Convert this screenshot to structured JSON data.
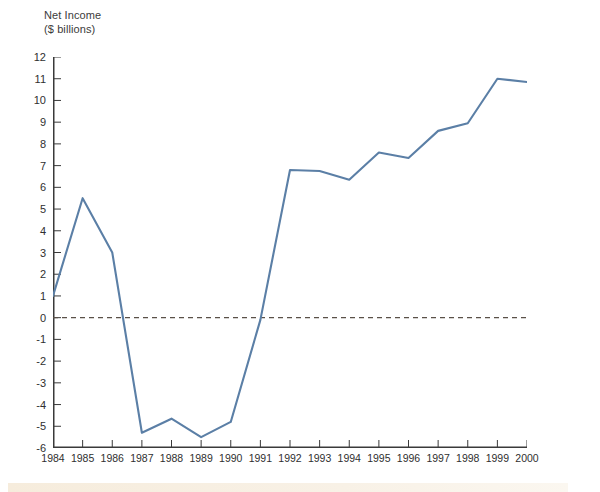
{
  "figure": {
    "title_line1": "Net Income",
    "title_line2": "($ billions)",
    "caption": "",
    "background_color": "#ffffff"
  },
  "colors": {
    "line": "#5b7fa6",
    "axis": "#3a3a3a",
    "zero_line": "#5a5048",
    "tick_label": "#2f2f2f",
    "title": "#3b3b3b",
    "caption_band": "#f6ecdc"
  },
  "chart_data": {
    "type": "line",
    "title": "Net Income ($ billions)",
    "xlabel": "",
    "ylabel": "Net Income ($ billions)",
    "x": [
      1984,
      1985,
      1986,
      1987,
      1988,
      1989,
      1990,
      1991,
      1992,
      1993,
      1994,
      1995,
      1996,
      1997,
      1998,
      1999,
      2000
    ],
    "categories": [
      "1984",
      "1985",
      "1986",
      "1987",
      "1988",
      "1989",
      "1990",
      "1991",
      "1992",
      "1993",
      "1994",
      "1995",
      "1996",
      "1997",
      "1998",
      "1999",
      "2000"
    ],
    "values": [
      1.0,
      5.5,
      3.0,
      -5.3,
      -4.65,
      -5.5,
      -4.8,
      -0.1,
      6.8,
      6.75,
      6.35,
      7.6,
      7.35,
      8.6,
      8.95,
      11.0,
      10.85
    ],
    "series": [
      {
        "name": "Net Income",
        "values": [
          1.0,
          5.5,
          3.0,
          -5.3,
          -4.65,
          -5.5,
          -4.8,
          -0.1,
          6.8,
          6.75,
          6.35,
          7.6,
          7.35,
          8.6,
          8.95,
          11.0,
          10.85
        ]
      }
    ],
    "ylim": [
      -6,
      12
    ],
    "xlim": [
      1984,
      2000
    ],
    "yticks": [
      12,
      11,
      10,
      9,
      8,
      7,
      6,
      5,
      4,
      3,
      2,
      1,
      0,
      -1,
      -2,
      -3,
      -4,
      -5,
      -6
    ],
    "ytick_labels": [
      "12",
      "11",
      "10",
      "9",
      "8",
      "7",
      "6",
      "5",
      "4",
      "3",
      "2",
      "1",
      "0",
      "-1",
      "-2",
      "-3",
      "-4",
      "-5",
      "-6"
    ],
    "xtick_labels": [
      "1984",
      "1985",
      "1986",
      "1987",
      "1988",
      "1989",
      "1990",
      "1991",
      "1992",
      "1993",
      "1994",
      "1995",
      "1996",
      "1997",
      "1998",
      "1999",
      "2000"
    ],
    "grid": false,
    "legend": false,
    "zero_reference_line": 0,
    "zero_line_style": "dashed"
  }
}
